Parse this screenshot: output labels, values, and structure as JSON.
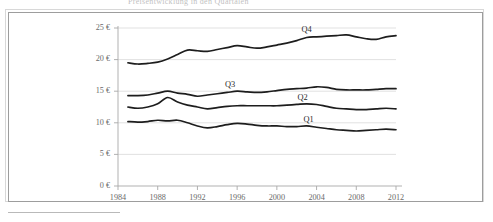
{
  "figure": {
    "title_sliver": "Preisentwicklung in den Quartalen",
    "frame": {
      "outer_color": "#d8d8d8",
      "inner_color": "#9d9d9d"
    },
    "line_color": "#1d1d1d",
    "grid_color": "#d9d9d9",
    "axis_color": "#a8a8a8"
  },
  "chart_data": {
    "type": "line",
    "title": "",
    "xlabel": "",
    "ylabel": "",
    "grid": true,
    "legend_position": "inline-labels",
    "x": [
      1985,
      1986,
      1987,
      1988,
      1989,
      1990,
      1991,
      1992,
      1993,
      1994,
      1995,
      1996,
      1997,
      1998,
      1999,
      2000,
      2001,
      2002,
      2003,
      2004,
      2005,
      2006,
      2007,
      2008,
      2009,
      2010,
      2011,
      2012
    ],
    "xticks": [
      "1984",
      "1988",
      "1992",
      "1996",
      "2000",
      "2004",
      "2008",
      "2012"
    ],
    "xtick_values": [
      1984,
      1988,
      1992,
      1996,
      2000,
      2004,
      2008,
      2012
    ],
    "xlim": [
      1984,
      2012
    ],
    "yticks": [
      "0 €",
      "5 €",
      "10 €",
      "15 €",
      "20 €",
      "25 €"
    ],
    "ytick_values": [
      0,
      5,
      10,
      15,
      20,
      25
    ],
    "ylim": [
      0,
      25
    ],
    "unit": "€",
    "series": [
      {
        "name": "Q1",
        "label": "Q1",
        "values": [
          10.2,
          10.1,
          10.2,
          10.4,
          10.3,
          10.4,
          10.0,
          9.5,
          9.2,
          9.4,
          9.7,
          9.9,
          9.8,
          9.6,
          9.5,
          9.5,
          9.4,
          9.4,
          9.5,
          9.3,
          9.1,
          8.9,
          8.8,
          8.7,
          8.8,
          8.9,
          9.0,
          8.9
        ]
      },
      {
        "name": "Q2",
        "label": "Q2",
        "values": [
          12.5,
          12.3,
          12.5,
          13.0,
          14.0,
          13.3,
          12.8,
          12.5,
          12.2,
          12.4,
          12.6,
          12.7,
          12.7,
          12.7,
          12.7,
          12.7,
          12.8,
          12.9,
          13.0,
          12.9,
          12.6,
          12.3,
          12.2,
          12.1,
          12.1,
          12.2,
          12.3,
          12.2
        ]
      },
      {
        "name": "Q3",
        "label": "Q3",
        "values": [
          14.3,
          14.3,
          14.4,
          14.7,
          15.0,
          14.7,
          14.5,
          14.2,
          14.4,
          14.6,
          14.8,
          15.0,
          14.9,
          14.8,
          14.9,
          15.1,
          15.3,
          15.4,
          15.5,
          15.7,
          15.6,
          15.3,
          15.2,
          15.2,
          15.2,
          15.3,
          15.4,
          15.4
        ]
      },
      {
        "name": "Q4",
        "label": "Q4",
        "values": [
          19.5,
          19.3,
          19.4,
          19.6,
          20.1,
          20.8,
          21.5,
          21.4,
          21.3,
          21.6,
          21.9,
          22.2,
          22.0,
          21.8,
          22.0,
          22.3,
          22.6,
          23.0,
          23.5,
          23.6,
          23.7,
          23.8,
          23.9,
          23.6,
          23.3,
          23.2,
          23.6,
          23.8
        ]
      }
    ],
    "series_label_positions": [
      {
        "name": "Q1",
        "x": 2003.2,
        "y": 10.2
      },
      {
        "name": "Q2",
        "x": 2002.6,
        "y": 13.6
      },
      {
        "name": "Q3",
        "x": 1995.3,
        "y": 15.6
      },
      {
        "name": "Q4",
        "x": 2003.0,
        "y": 24.3
      }
    ]
  }
}
